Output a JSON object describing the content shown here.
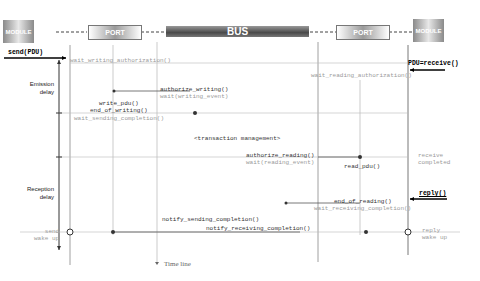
{
  "diagram": {
    "lifelines": {
      "module_left": "MODULE",
      "port_left": "PORT",
      "bus": "BUS",
      "port_right": "PORT",
      "module_right": "MODULE"
    },
    "side_labels": {
      "emission_delay": [
        "Emission",
        "delay"
      ],
      "reception_delay": [
        "Reception",
        "delay"
      ]
    },
    "messages": {
      "send_pdu": "send(PDU)",
      "wait_writing_authorization": "wait_writing_authorization()",
      "pdu_receive": "PDU=receive()",
      "wait_reading_authorization": "wait_reading_authorization()",
      "authorize_writing": "authorize_writing()",
      "wait_writing_event": "wait(writing_event)",
      "write_pdu": "write_pdu()",
      "end_of_writing": "end_of_writing()",
      "wait_sending_completion": "wait_sending_completion()",
      "transaction_management": "<transaction management>",
      "authorize_reading": "authorize_reading()",
      "wait_reading_event": "wait(reading_event)",
      "read_pdu": "read_pdu()",
      "receive_completed": [
        "receive",
        "completed"
      ],
      "reply": "reply()",
      "end_of_reading": "end_of_reading()",
      "wait_receiving_completion": "wait_receiving_completion()",
      "notify_sending_completion": "notify_sending_completion()",
      "notify_receiving_completion": "notify_receiving_completion()",
      "send_wake_up": [
        "send",
        "wake up"
      ],
      "reply_wake_up": [
        "reply",
        "wake up"
      ]
    },
    "time_line": "Time line"
  }
}
